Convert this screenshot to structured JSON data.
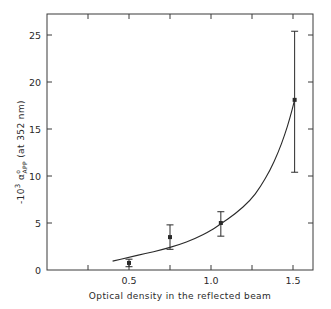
{
  "chart_data": {
    "type": "scatter",
    "title": "",
    "xlabel": "Optical density in the reflected beam",
    "ylabel": {
      "prefix": "-10",
      "exponent": "3",
      "symbol": "α",
      "symbol_sup": "o",
      "symbol_sub": "APP",
      "suffix": "(at 352 nm)",
      "full": "-10³ α°APP (at 352 nm)"
    },
    "xlim": [
      0,
      1.62
    ],
    "ylim": [
      0,
      27
    ],
    "x_ticks": [
      {
        "value": 0.25,
        "label": ""
      },
      {
        "value": 0.5,
        "label": "0.5"
      },
      {
        "value": 0.75,
        "label": ""
      },
      {
        "value": 1.0,
        "label": "1.0"
      },
      {
        "value": 1.25,
        "label": ""
      },
      {
        "value": 1.5,
        "label": "1.5"
      }
    ],
    "y_ticks": [
      {
        "value": 0,
        "label": "0"
      },
      {
        "value": 5,
        "label": "5"
      },
      {
        "value": 10,
        "label": "10"
      },
      {
        "value": 15,
        "label": "15"
      },
      {
        "value": 20,
        "label": "20"
      },
      {
        "value": 25,
        "label": "25"
      }
    ],
    "grid": false,
    "legend": null,
    "series": [
      {
        "name": "measured",
        "kind": "points_with_error_bars",
        "points": [
          {
            "x": 0.5,
            "y": 0.75,
            "err_low": 0.35,
            "err_high": 1.15
          },
          {
            "x": 0.75,
            "y": 3.5,
            "err_low": 2.2,
            "err_high": 4.8
          },
          {
            "x": 1.06,
            "y": 5.0,
            "err_low": 3.6,
            "err_high": 6.2
          },
          {
            "x": 1.51,
            "y": 18.1,
            "err_low": 10.4,
            "err_high": 25.4
          }
        ]
      },
      {
        "name": "fitted curve",
        "kind": "line",
        "points": [
          {
            "x": 0.4,
            "y": 0.95
          },
          {
            "x": 0.5,
            "y": 1.35
          },
          {
            "x": 0.6,
            "y": 1.75
          },
          {
            "x": 0.7,
            "y": 2.15
          },
          {
            "x": 0.8,
            "y": 2.65
          },
          {
            "x": 0.9,
            "y": 3.3
          },
          {
            "x": 1.0,
            "y": 4.2
          },
          {
            "x": 1.06,
            "y": 4.9
          },
          {
            "x": 1.15,
            "y": 6.0
          },
          {
            "x": 1.24,
            "y": 7.4
          },
          {
            "x": 1.3,
            "y": 8.8
          },
          {
            "x": 1.36,
            "y": 10.6
          },
          {
            "x": 1.41,
            "y": 12.5
          },
          {
            "x": 1.45,
            "y": 14.4
          },
          {
            "x": 1.48,
            "y": 16.1
          },
          {
            "x": 1.51,
            "y": 18.1
          }
        ]
      }
    ]
  },
  "style": {
    "ink": "#2a2a2a",
    "axis": "#3a3a3a",
    "background": "#ffffff"
  }
}
